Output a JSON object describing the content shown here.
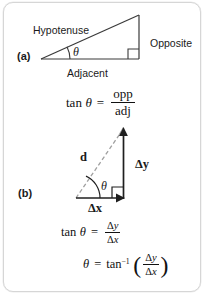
{
  "figure": {
    "name": "trigonometry-right-triangle-and-vector-components",
    "background_color": "#ffffff",
    "border_color": "#d6d6d6",
    "stroke_color": "#3a3a3a",
    "dashed_stroke_color": "#9a9a9a"
  },
  "panel_a": {
    "label": "(a)",
    "hypotenuse_label": "Hypotenuse",
    "opposite_label": "Opposite",
    "adjacent_label": "Adjacent",
    "angle_symbol": "θ",
    "triangle": {
      "vertex_left": [
        40,
        58
      ],
      "vertex_right_bottom": [
        138,
        58
      ],
      "vertex_apex": [
        138,
        14
      ],
      "right_angle_marker": true
    }
  },
  "panel_b": {
    "label": "(b)",
    "vector_label": "d",
    "delta_y_label": "Δy",
    "delta_x_label": "Δx",
    "angle_symbol": "θ",
    "triangle": {
      "origin": [
        75,
        197
      ],
      "corner": [
        122,
        197
      ],
      "tip": [
        122,
        127
      ],
      "right_angle_marker": true,
      "hypotenuse_style": "dashed",
      "arrows": [
        "delta-x",
        "delta-y",
        "d"
      ]
    }
  },
  "formulas": {
    "tan_opp_adj": {
      "lhs_fn": "tan",
      "lhs_var": "θ",
      "equals": "=",
      "numerator": "opp",
      "denominator": "adj",
      "plain": "tan θ = opp / adj"
    },
    "tan_delta": {
      "lhs_fn": "tan",
      "lhs_var": "θ",
      "equals": "=",
      "numerator_delta": "Δ",
      "numerator_var": "y",
      "denominator_delta": "Δ",
      "denominator_var": "x",
      "plain": "tan θ = Δy / Δx"
    },
    "theta_arctan": {
      "lhs_var": "θ",
      "equals": "=",
      "fn": "tan",
      "exponent": "−1",
      "open_paren": "(",
      "close_paren": ")",
      "numerator_delta": "Δ",
      "numerator_var": "y",
      "denominator_delta": "Δ",
      "denominator_var": "x",
      "plain": "θ = tan⁻¹ (Δy / Δx)"
    }
  }
}
